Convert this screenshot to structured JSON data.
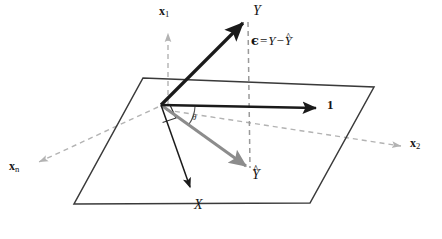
{
  "figure": {
    "type": "vector-geometry-diagram",
    "background_color": "#ffffff",
    "width": 442,
    "height": 239
  },
  "colors": {
    "vector_black": "#1a1a1a",
    "vector_gray": "#8c8c8c",
    "axis_dashed_gray": "#b3b3b3",
    "plane_outline": "#3a3a3a",
    "projection_dashed": "#9a9a9a",
    "label_text": "#141414",
    "angle_arc": "#555555"
  },
  "labels": {
    "x1": {
      "text": "x",
      "subscript": "1",
      "style": "bold-roman",
      "x": 161,
      "y": 7
    },
    "x2": {
      "text": "x",
      "subscript": "2",
      "style": "bold-roman",
      "x": 412,
      "y": 137
    },
    "xn": {
      "text": "x",
      "subscript": "n",
      "style": "bold-roman",
      "x": 10,
      "y": 161
    },
    "Y": {
      "text": "Y",
      "style": "italic",
      "x": 254,
      "y": 5
    },
    "Yhat": {
      "text": "Y",
      "accent": "hat",
      "style": "italic",
      "x": 253,
      "y": 169
    },
    "X": {
      "text": "X",
      "style": "italic",
      "x": 195,
      "y": 199
    },
    "one": {
      "text": "1",
      "style": "bold-roman",
      "x": 328,
      "y": 98
    },
    "theta": {
      "text": "θ",
      "style": "italic",
      "x": 193,
      "y": 114
    },
    "residual_equation": {
      "epsilon": "ϵ",
      "equals": "=",
      "Y": "Y",
      "minus": "−",
      "Yhat": "Y",
      "full_text": "ϵ = Y − Ŷ",
      "x": 251,
      "y": 34
    }
  },
  "vectors": [
    {
      "name": "Y",
      "description": "response vector",
      "color": "#1a1a1a",
      "width": 3.2,
      "from": [
        161,
        105
      ],
      "to": [
        248,
        18
      ],
      "arrowhead": true,
      "style": "solid"
    },
    {
      "name": "Yhat",
      "description": "fitted values / projection onto column space",
      "color": "#8c8c8c",
      "width": 3.0,
      "from": [
        161,
        105
      ],
      "to": [
        250,
        169
      ],
      "arrowhead": true,
      "style": "solid"
    },
    {
      "name": "one",
      "description": "intercept vector of ones",
      "color": "#1a1a1a",
      "width": 2.4,
      "from": [
        161,
        105
      ],
      "to": [
        320,
        108
      ],
      "arrowhead": true,
      "style": "solid"
    },
    {
      "name": "X",
      "description": "predictor vector",
      "color": "#1a1a1a",
      "width": 1.5,
      "from": [
        161,
        105
      ],
      "to": [
        192,
        192
      ],
      "arrowhead": true,
      "style": "solid"
    }
  ],
  "axes": [
    {
      "name": "x1",
      "color": "#b3b3b3",
      "from": [
        168,
        104
      ],
      "to": [
        168,
        32
      ],
      "style": "dashed",
      "arrowhead": true
    },
    {
      "name": "x2",
      "color": "#b3b3b3",
      "from": [
        166,
        110
      ],
      "to": [
        403,
        147
      ],
      "style": "dashed",
      "arrowhead": true
    },
    {
      "name": "xn",
      "color": "#b3b3b3",
      "from": [
        158,
        107
      ],
      "to": [
        37,
        163
      ],
      "style": "dashed",
      "arrowhead": true
    }
  ],
  "plane": {
    "name": "column-space-plane",
    "description": "span of 1 and X",
    "outline_color": "#3a3a3a",
    "fill": "none",
    "corners": [
      [
        143,
        78
      ],
      [
        374,
        87
      ],
      [
        310,
        203
      ],
      [
        74,
        204
      ]
    ]
  },
  "residual_line": {
    "name": "residual-dashed-line",
    "description": "dashed segment from Y to Yhat showing epsilon",
    "color": "#9a9a9a",
    "style": "dashed",
    "from": [
      248,
      20
    ],
    "to": [
      250,
      170
    ]
  },
  "angle_marks": [
    {
      "name": "theta-arc",
      "description": "angle between 1 vector and Yhat",
      "color": "#555555",
      "center": [
        161,
        105
      ],
      "radius": 34,
      "start_angle_deg": 1,
      "end_angle_deg": 36
    },
    {
      "name": "right-angle-square",
      "description": "right angle mark at origin",
      "color": "#333333",
      "points": [
        [
          162,
          118
        ],
        [
          174,
          114
        ],
        [
          170,
          104
        ]
      ]
    }
  ]
}
